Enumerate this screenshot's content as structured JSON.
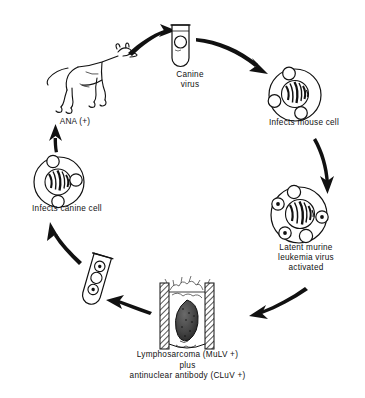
{
  "figure": {
    "type": "cyclic-flow-diagram",
    "title": "",
    "background_color": "#ffffff",
    "stroke_color": "#111111",
    "nodes": [
      {
        "id": "canine-virus",
        "label": "Canine\nvirus",
        "icon": "test-tube-icon",
        "contents": "one empty virion circle",
        "position": "top"
      },
      {
        "id": "infects-mouse-cell",
        "label": "Infects mouse cell",
        "icon": "cell-icon",
        "contents": "cell with striped nucleus and three empty virion circles",
        "position": "upper-right"
      },
      {
        "id": "latent-murine",
        "label": "Latent murine\nleukemia virus\nactivated",
        "icon": "cell-icon",
        "contents": "cell with striped nucleus, two empty and three dotted virion circles",
        "position": "lower-right"
      },
      {
        "id": "lymphosarcoma",
        "label": "Lymphosarcoma (MuLV +)\nplus\nantinuclear antibody (CLuV +)",
        "icon": "tumor-specimen-icon",
        "contents": "hatched tissue panel with dark tumor mass",
        "position": "bottom"
      },
      {
        "id": "serum-tube",
        "label": "",
        "icon": "test-tube-icon",
        "contents": "two dotted virion circles and one empty circle",
        "position": "lower-left"
      },
      {
        "id": "infects-canine-cell",
        "label": "Infects canine cell",
        "icon": "cell-icon",
        "contents": "cell with striped nucleus and three empty virion circles",
        "position": "upper-left"
      },
      {
        "id": "dog",
        "label": "ANA (+)",
        "icon": "dog-icon",
        "contents": "line drawing of a standing dog facing right",
        "position": "top-left"
      }
    ],
    "arrows": [
      {
        "from": "dog",
        "to": "canine-virus"
      },
      {
        "from": "canine-virus",
        "to": "infects-mouse-cell"
      },
      {
        "from": "infects-mouse-cell",
        "to": "latent-murine"
      },
      {
        "from": "latent-murine",
        "to": "lymphosarcoma"
      },
      {
        "from": "lymphosarcoma",
        "to": "serum-tube"
      },
      {
        "from": "serum-tube",
        "to": "infects-canine-cell"
      },
      {
        "from": "infects-canine-cell",
        "to": "dog"
      }
    ]
  }
}
